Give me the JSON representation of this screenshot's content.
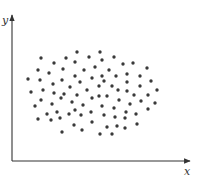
{
  "chart_data": {
    "type": "scatter",
    "title": "",
    "xlabel": "x",
    "ylabel": "y",
    "grid": false,
    "legend": null,
    "ticks": false,
    "axis": {
      "origin": [
        12,
        161
      ],
      "x_end": 190,
      "y_end": 15,
      "color": "#333333"
    },
    "point_color": "#3a3a3a",
    "point_radius": 1.7,
    "points_px": [
      [
        77,
        52
      ],
      [
        100,
        52
      ],
      [
        41,
        58
      ],
      [
        66,
        58
      ],
      [
        89,
        57
      ],
      [
        114,
        57
      ],
      [
        102,
        60
      ],
      [
        54,
        63
      ],
      [
        75,
        62
      ],
      [
        123,
        64
      ],
      [
        133,
        63
      ],
      [
        38,
        70
      ],
      [
        63,
        69
      ],
      [
        84,
        70
      ],
      [
        95,
        67
      ],
      [
        109,
        70
      ],
      [
        147,
        68
      ],
      [
        49,
        73
      ],
      [
        75,
        76
      ],
      [
        102,
        76
      ],
      [
        116,
        76
      ],
      [
        127,
        74
      ],
      [
        140,
        76
      ],
      [
        28,
        79
      ],
      [
        40,
        80
      ],
      [
        62,
        80
      ],
      [
        80,
        82
      ],
      [
        92,
        78
      ],
      [
        104,
        81
      ],
      [
        127,
        82
      ],
      [
        151,
        81
      ],
      [
        53,
        84
      ],
      [
        70,
        87
      ],
      [
        99,
        86
      ],
      [
        112,
        86
      ],
      [
        140,
        86
      ],
      [
        31,
        92
      ],
      [
        43,
        90
      ],
      [
        64,
        94
      ],
      [
        87,
        90
      ],
      [
        77,
        95
      ],
      [
        118,
        90
      ],
      [
        127,
        91
      ],
      [
        157,
        90
      ],
      [
        54,
        93
      ],
      [
        99,
        96
      ],
      [
        107,
        96
      ],
      [
        134,
        95
      ],
      [
        148,
        95
      ],
      [
        41,
        100
      ],
      [
        61,
        98
      ],
      [
        92,
        98
      ],
      [
        72,
        102
      ],
      [
        119,
        100
      ],
      [
        141,
        101
      ],
      [
        155,
        103
      ],
      [
        35,
        106
      ],
      [
        52,
        104
      ],
      [
        83,
        105
      ],
      [
        102,
        106
      ],
      [
        130,
        104
      ],
      [
        57,
        112
      ],
      [
        47,
        114
      ],
      [
        69,
        114
      ],
      [
        75,
        110
      ],
      [
        91,
        112
      ],
      [
        114,
        108
      ],
      [
        148,
        109
      ],
      [
        60,
        118
      ],
      [
        81,
        115
      ],
      [
        104,
        115
      ],
      [
        126,
        112
      ],
      [
        136,
        114
      ],
      [
        38,
        119
      ],
      [
        51,
        120
      ],
      [
        115,
        117
      ],
      [
        125,
        118
      ],
      [
        74,
        125
      ],
      [
        92,
        122
      ],
      [
        107,
        127
      ],
      [
        117,
        126
      ],
      [
        137,
        124
      ],
      [
        125,
        128
      ],
      [
        62,
        132
      ],
      [
        82,
        130
      ],
      [
        100,
        134
      ],
      [
        112,
        134
      ]
    ]
  },
  "axes": {
    "x_label": "x",
    "y_label": "y"
  }
}
